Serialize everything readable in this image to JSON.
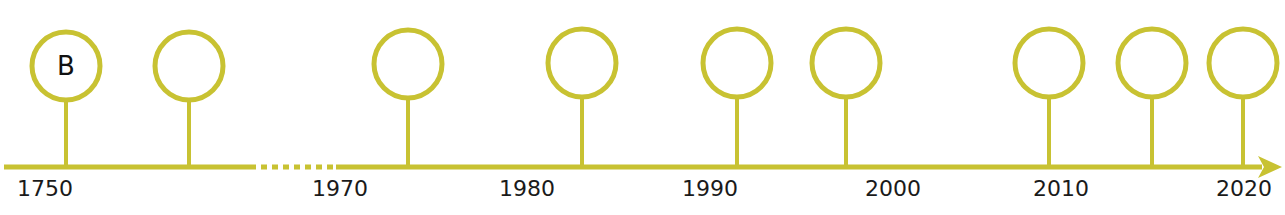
{
  "colors": {
    "line": "#c8c232",
    "text": "#1a1a1a",
    "circle_fill": "#ffffff"
  },
  "axis": {
    "y": 167,
    "solid_segments": [
      [
        4,
        250
      ],
      [
        336,
        1262
      ]
    ],
    "dotted_segment": [
      250,
      336
    ],
    "arrow_tip_x": 1282
  },
  "labels": [
    {
      "text": "1750",
      "x": 45
    },
    {
      "text": "1970",
      "x": 340
    },
    {
      "text": "1980",
      "x": 527
    },
    {
      "text": "1990",
      "x": 710
    },
    {
      "text": "2000",
      "x": 893
    },
    {
      "text": "2010",
      "x": 1061
    },
    {
      "text": "2020",
      "x": 1244
    }
  ],
  "markers": [
    {
      "x": 66,
      "cy": 66,
      "letter": "B"
    },
    {
      "x": 189,
      "cy": 66,
      "letter": ""
    },
    {
      "x": 408,
      "cy": 64,
      "letter": ""
    },
    {
      "x": 582,
      "cy": 63,
      "letter": ""
    },
    {
      "x": 737,
      "cy": 63,
      "letter": ""
    },
    {
      "x": 846,
      "cy": 63,
      "letter": ""
    },
    {
      "x": 1049,
      "cy": 63,
      "letter": ""
    },
    {
      "x": 1152,
      "cy": 63,
      "letter": ""
    },
    {
      "x": 1243,
      "cy": 63,
      "letter": ""
    }
  ]
}
